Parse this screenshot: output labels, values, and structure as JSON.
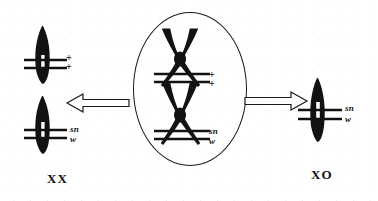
{
  "figure": {
    "type": "genetics-chromosome-diagram",
    "background_color": "#ffffff",
    "ink_color": "#111111"
  },
  "center": {
    "container_name": "cell-oval",
    "chromosomes": [
      {
        "id": "upper-crossed-pair",
        "shape": "crossed-x-chromosome-pair",
        "markers": [
          "+",
          "+"
        ]
      },
      {
        "id": "lower-crossed-pair",
        "shape": "crossed-x-chromosome-pair",
        "markers": [
          "sn",
          "w"
        ]
      }
    ],
    "upper_marker_line1": "+",
    "upper_marker_line2": "+",
    "lower_marker_line1": "sn",
    "lower_marker_line2": "w"
  },
  "arrows": {
    "left": {
      "label": "",
      "direction": "left",
      "style": "hollow-outline"
    },
    "right": {
      "label": "",
      "direction": "right",
      "style": "hollow-outline"
    }
  },
  "left_product": {
    "caption": "XX",
    "chromosomes": [
      {
        "id": "left-top-chromosome",
        "marker_line1": "+",
        "marker_line2": "+"
      },
      {
        "id": "left-bottom-chromosome",
        "marker_line1": "sn",
        "marker_line2": "w"
      }
    ],
    "top_marker_line1": "+",
    "top_marker_line2": "+",
    "bottom_marker_line1": "sn",
    "bottom_marker_line2": "w"
  },
  "right_product": {
    "caption": "XO",
    "chromosomes": [
      {
        "id": "right-chromosome",
        "marker_line1": "sn",
        "marker_line2": "w"
      }
    ],
    "marker_line1": "sn",
    "marker_line2": "w"
  }
}
